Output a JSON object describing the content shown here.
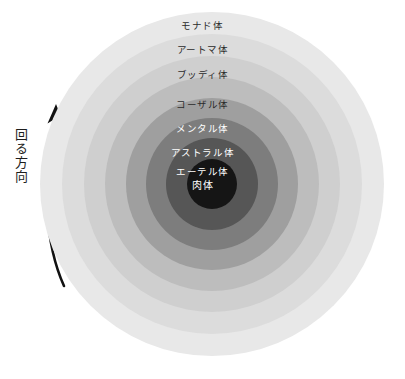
{
  "diagram": {
    "type": "concentric-rings",
    "title_visible": false,
    "center": {
      "x": 212,
      "y": 184
    },
    "outer_radius": 172,
    "rings": [
      {
        "index": 0,
        "label": "モナド体",
        "romaji_name": "monad-body",
        "color": "#e8e8e8",
        "radius": 172,
        "label_color": "dark",
        "label_y": 21
      },
      {
        "index": 1,
        "label": "アートマ体",
        "romaji_name": "atma-body",
        "color": "#dcdcdc",
        "radius": 150,
        "label_color": "dark",
        "label_y": 45
      },
      {
        "index": 2,
        "label": "ブッディ体",
        "romaji_name": "buddhi-body",
        "color": "#cfcfcf",
        "radius": 128,
        "label_color": "dark",
        "label_y": 70
      },
      {
        "index": 3,
        "label": "コーザル体",
        "romaji_name": "causal-body",
        "color": "#bdbdbd",
        "radius": 107,
        "label_color": "dark",
        "label_y": 100
      },
      {
        "index": 4,
        "label": "メンタル体",
        "romaji_name": "mental-body",
        "color": "#9f9f9f",
        "radius": 86,
        "label_color": "light",
        "label_y": 124
      },
      {
        "index": 5,
        "label": "アストラル体",
        "romaji_name": "astral-body",
        "color": "#7d7d7d",
        "radius": 66,
        "label_color": "light",
        "label_y": 148
      },
      {
        "index": 6,
        "label": "エーテル体",
        "romaji_name": "etheric-body",
        "color": "#565656",
        "radius": 46,
        "label_color": "light",
        "label_y": 167
      },
      {
        "index": 7,
        "label": "肉体",
        "romaji_name": "physical-body",
        "color": "#151515",
        "radius": 25,
        "label_color": "core",
        "label_y": 181
      }
    ],
    "annotation": {
      "rotation_label": "回る方向",
      "rotation_meaning": "direction of rotation",
      "arrow_direction": "upward",
      "arrow_shape": "curved-arc",
      "arrow_color": "#111111"
    },
    "person": {
      "name": "human-figure",
      "fill_color": "#0d0d0d",
      "outline_color": "#ffffff"
    }
  }
}
